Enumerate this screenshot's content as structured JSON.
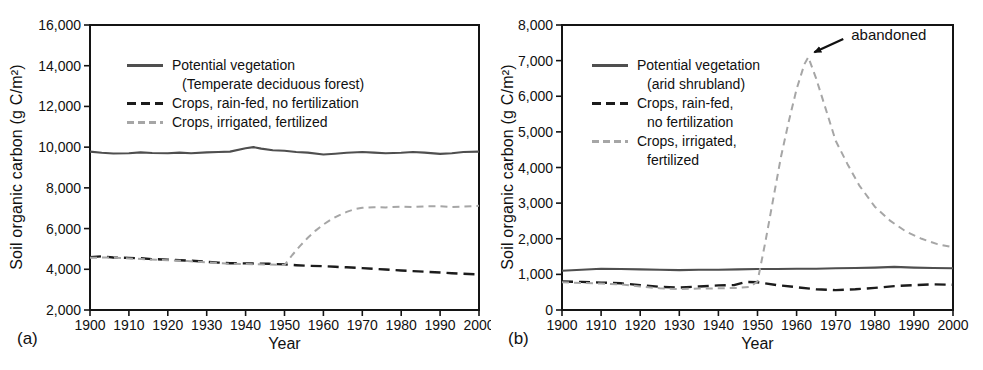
{
  "figure": {
    "background": "#ffffff",
    "text_color": "#111111",
    "frame_color": "#141414"
  },
  "chart_data": [
    {
      "panel_label": "(a)",
      "type": "line",
      "title": "",
      "xlabel": "Year",
      "ylabel": "Soil organic carbon (g C/m²)",
      "xlim": [
        1900,
        2000
      ],
      "ylim": [
        2000,
        16000
      ],
      "x_ticks": [
        1900,
        1910,
        1920,
        1930,
        1940,
        1950,
        1960,
        1970,
        1980,
        1990,
        2000
      ],
      "y_ticks": [
        2000,
        4000,
        6000,
        8000,
        10000,
        12000,
        14000,
        16000
      ],
      "grid": false,
      "legend_position": "upper-left-inside",
      "series": [
        {
          "name": "Potential vegetation (Temperate deciduous forest)",
          "legend_lines": [
            "Potential vegetation",
            "(Temperate deciduous forest)"
          ],
          "style": "solid",
          "color": "#4f4f4f",
          "points": [
            [
              1900,
              9780
            ],
            [
              1903,
              9720
            ],
            [
              1906,
              9690
            ],
            [
              1910,
              9700
            ],
            [
              1913,
              9740
            ],
            [
              1916,
              9710
            ],
            [
              1920,
              9700
            ],
            [
              1923,
              9730
            ],
            [
              1926,
              9700
            ],
            [
              1930,
              9740
            ],
            [
              1933,
              9760
            ],
            [
              1936,
              9780
            ],
            [
              1940,
              9950
            ],
            [
              1942,
              10000
            ],
            [
              1944,
              9930
            ],
            [
              1947,
              9850
            ],
            [
              1950,
              9820
            ],
            [
              1953,
              9760
            ],
            [
              1956,
              9730
            ],
            [
              1960,
              9640
            ],
            [
              1963,
              9680
            ],
            [
              1966,
              9720
            ],
            [
              1970,
              9760
            ],
            [
              1973,
              9730
            ],
            [
              1976,
              9700
            ],
            [
              1980,
              9720
            ],
            [
              1983,
              9760
            ],
            [
              1986,
              9730
            ],
            [
              1990,
              9670
            ],
            [
              1993,
              9700
            ],
            [
              1996,
              9760
            ],
            [
              2000,
              9780
            ]
          ]
        },
        {
          "name": "Crops, rain-fed, no fertilization",
          "legend_lines": [
            "Crops, rain-fed, no fertilization"
          ],
          "style": "long-dash",
          "color": "#1c1c1c",
          "points": [
            [
              1900,
              4600
            ],
            [
              1903,
              4640
            ],
            [
              1906,
              4580
            ],
            [
              1910,
              4560
            ],
            [
              1913,
              4540
            ],
            [
              1916,
              4500
            ],
            [
              1920,
              4470
            ],
            [
              1923,
              4440
            ],
            [
              1926,
              4420
            ],
            [
              1930,
              4370
            ],
            [
              1933,
              4330
            ],
            [
              1936,
              4300
            ],
            [
              1940,
              4290
            ],
            [
              1943,
              4280
            ],
            [
              1946,
              4270
            ],
            [
              1950,
              4240
            ],
            [
              1953,
              4200
            ],
            [
              1956,
              4170
            ],
            [
              1960,
              4150
            ],
            [
              1963,
              4120
            ],
            [
              1966,
              4100
            ],
            [
              1970,
              4060
            ],
            [
              1973,
              4020
            ],
            [
              1976,
              3990
            ],
            [
              1980,
              3940
            ],
            [
              1983,
              3910
            ],
            [
              1986,
              3880
            ],
            [
              1990,
              3840
            ],
            [
              1993,
              3810
            ],
            [
              1996,
              3780
            ],
            [
              2000,
              3750
            ]
          ]
        },
        {
          "name": "Crops, irrigated, fertilized",
          "legend_lines": [
            "Crops, irrigated, fertilized"
          ],
          "style": "light-dash",
          "color": "#a6a6a6",
          "points": [
            [
              1900,
              4570
            ],
            [
              1905,
              4580
            ],
            [
              1910,
              4530
            ],
            [
              1915,
              4490
            ],
            [
              1920,
              4440
            ],
            [
              1925,
              4400
            ],
            [
              1930,
              4340
            ],
            [
              1935,
              4280
            ],
            [
              1940,
              4260
            ],
            [
              1945,
              4240
            ],
            [
              1950,
              4210
            ],
            [
              1952,
              4700
            ],
            [
              1954,
              5150
            ],
            [
              1956,
              5550
            ],
            [
              1958,
              5900
            ],
            [
              1960,
              6200
            ],
            [
              1962,
              6450
            ],
            [
              1964,
              6650
            ],
            [
              1966,
              6820
            ],
            [
              1968,
              6950
            ],
            [
              1970,
              7020
            ],
            [
              1973,
              7050
            ],
            [
              1976,
              7040
            ],
            [
              1980,
              7080
            ],
            [
              1983,
              7060
            ],
            [
              1986,
              7090
            ],
            [
              1990,
              7100
            ],
            [
              1993,
              7060
            ],
            [
              1996,
              7080
            ],
            [
              2000,
              7120
            ]
          ]
        }
      ],
      "annotation": null
    },
    {
      "panel_label": "(b)",
      "type": "line",
      "title": "",
      "xlabel": "Year",
      "ylabel": "Soil organic carbon (g C/m²)",
      "xlim": [
        1900,
        2000
      ],
      "ylim": [
        0,
        8000
      ],
      "x_ticks": [
        1900,
        1910,
        1920,
        1930,
        1940,
        1950,
        1960,
        1970,
        1980,
        1990,
        2000
      ],
      "y_ticks": [
        0,
        1000,
        2000,
        3000,
        4000,
        5000,
        6000,
        7000,
        8000
      ],
      "grid": false,
      "legend_position": "upper-left-inside",
      "series": [
        {
          "name": "Potential vegetation (arid shrubland)",
          "legend_lines": [
            "Potential vegetation",
            "(arid shrubland)"
          ],
          "style": "solid",
          "color": "#4f4f4f",
          "points": [
            [
              1900,
              1100
            ],
            [
              1905,
              1130
            ],
            [
              1910,
              1160
            ],
            [
              1915,
              1150
            ],
            [
              1920,
              1140
            ],
            [
              1925,
              1130
            ],
            [
              1930,
              1120
            ],
            [
              1935,
              1130
            ],
            [
              1940,
              1130
            ],
            [
              1945,
              1140
            ],
            [
              1950,
              1150
            ],
            [
              1955,
              1150
            ],
            [
              1960,
              1160
            ],
            [
              1965,
              1160
            ],
            [
              1970,
              1170
            ],
            [
              1975,
              1180
            ],
            [
              1980,
              1190
            ],
            [
              1985,
              1210
            ],
            [
              1990,
              1190
            ],
            [
              1995,
              1180
            ],
            [
              2000,
              1170
            ]
          ]
        },
        {
          "name": "Crops, rain-fed, no fertilization",
          "legend_lines": [
            "Crops, rain-fed,",
            "no fertilization"
          ],
          "style": "long-dash",
          "color": "#1c1c1c",
          "points": [
            [
              1900,
              800
            ],
            [
              1905,
              790
            ],
            [
              1910,
              770
            ],
            [
              1915,
              750
            ],
            [
              1920,
              700
            ],
            [
              1925,
              650
            ],
            [
              1930,
              630
            ],
            [
              1935,
              660
            ],
            [
              1940,
              690
            ],
            [
              1944,
              700
            ],
            [
              1947,
              790
            ],
            [
              1950,
              780
            ],
            [
              1955,
              700
            ],
            [
              1960,
              640
            ],
            [
              1965,
              580
            ],
            [
              1970,
              560
            ],
            [
              1975,
              580
            ],
            [
              1980,
              620
            ],
            [
              1985,
              670
            ],
            [
              1990,
              700
            ],
            [
              1995,
              720
            ],
            [
              2000,
              710
            ]
          ]
        },
        {
          "name": "Crops, irrigated, fertilized",
          "legend_lines": [
            "Crops, irrigated,",
            "fertilized"
          ],
          "style": "light-dash",
          "color": "#a6a6a6",
          "points": [
            [
              1900,
              780
            ],
            [
              1905,
              760
            ],
            [
              1910,
              740
            ],
            [
              1915,
              720
            ],
            [
              1920,
              660
            ],
            [
              1925,
              610
            ],
            [
              1930,
              590
            ],
            [
              1935,
              600
            ],
            [
              1940,
              610
            ],
            [
              1945,
              620
            ],
            [
              1948,
              650
            ],
            [
              1950,
              800
            ],
            [
              1952,
              1900
            ],
            [
              1954,
              3100
            ],
            [
              1956,
              4300
            ],
            [
              1958,
              5300
            ],
            [
              1960,
              6200
            ],
            [
              1962,
              6900
            ],
            [
              1963,
              7100
            ],
            [
              1965,
              6500
            ],
            [
              1967,
              5800
            ],
            [
              1970,
              4750
            ],
            [
              1973,
              4100
            ],
            [
              1976,
              3500
            ],
            [
              1980,
              2900
            ],
            [
              1984,
              2500
            ],
            [
              1988,
              2200
            ],
            [
              1992,
              2000
            ],
            [
              1996,
              1850
            ],
            [
              2000,
              1760
            ]
          ]
        }
      ],
      "annotation": {
        "text": "abandoned",
        "target_x": 1963.5,
        "target_y": 7150,
        "text_x": 1975,
        "text_y": 7720
      }
    }
  ]
}
